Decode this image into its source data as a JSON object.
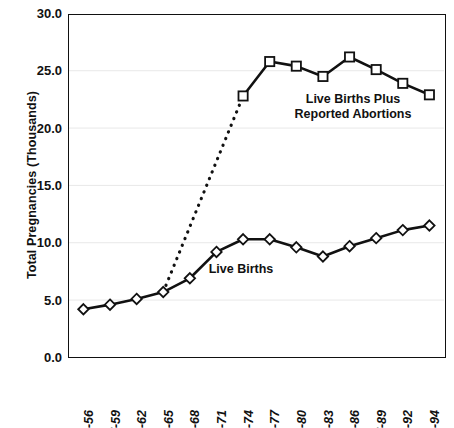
{
  "chart_data": {
    "type": "line",
    "title": "",
    "xlabel": "",
    "ylabel": "Total Pregnancies (Thousands)",
    "ylim": [
      0.0,
      30.0
    ],
    "yticks": [
      "0.0",
      "5.0",
      "10.0",
      "15.0",
      "20.0",
      "25.0",
      "30.0"
    ],
    "ytick_values": [
      0.0,
      5.0,
      10.0,
      15.0,
      20.0,
      25.0,
      30.0
    ],
    "grid": "faint horizontal gridlines",
    "legend_position": "inline annotations",
    "categories": [
      "55-56",
      "57-59",
      "60-62",
      "63-65",
      "66-68",
      "69-71",
      "72-74",
      "75-77",
      "78-80",
      "81-83",
      "84-86",
      "87-89",
      "90-92",
      "93-94"
    ],
    "series": [
      {
        "name": "Live Births",
        "marker": "diamond",
        "line": "solid",
        "values": [
          4.2,
          4.6,
          5.1,
          5.7,
          6.9,
          9.2,
          10.3,
          10.3,
          9.6,
          8.8,
          9.7,
          10.4,
          11.1,
          11.5
        ]
      },
      {
        "name": "Live Births Plus Reported Abortions",
        "marker": "square",
        "line": "solid",
        "connector": "dotted from 63-65",
        "values": [
          null,
          null,
          null,
          5.7,
          null,
          null,
          22.8,
          25.8,
          25.4,
          24.5,
          26.2,
          25.1,
          23.9,
          22.9
        ]
      }
    ],
    "annotations": [
      {
        "text": "Live Births Plus\nReported Abortions",
        "category": "81-83",
        "value": 21.0
      },
      {
        "text": "Live Births",
        "category": "75-77",
        "value": 8.5
      }
    ]
  },
  "axis": {
    "y_title": "Total Pregnancies (Thousands)"
  },
  "labels": {
    "upper_series": "Live Births Plus\nReported Abortions",
    "lower_series": "Live Births"
  },
  "colors": {
    "line": "#111111",
    "marker_fill": "#ffffff",
    "background": "#ffffff",
    "grid": "#e8e8e8"
  }
}
